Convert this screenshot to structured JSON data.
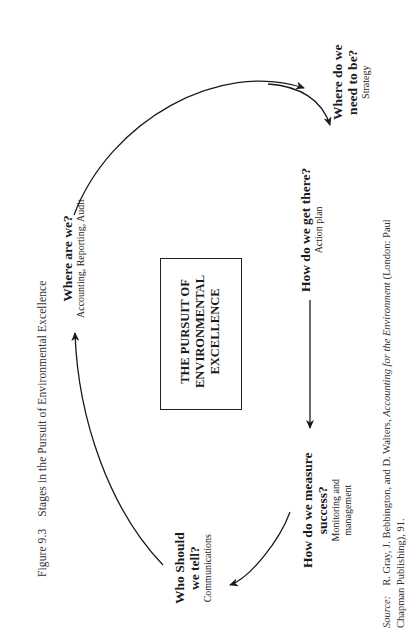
{
  "figure": {
    "number": "Figure 9.3",
    "title": "Stages in the Pursuit of Environmental Excellence"
  },
  "center_box": {
    "lines": [
      "THE PURSUIT OF",
      "ENVIRONMENTAL",
      "EXCELLENCE"
    ]
  },
  "stages": [
    {
      "id": "where-are-we",
      "question_lines": [
        "Where are we?"
      ],
      "detail_lines": [
        "Accounting,  Reporting, Audit"
      ]
    },
    {
      "id": "where-do-we-need-to-be",
      "question_lines": [
        "Where do we",
        "need to be?"
      ],
      "detail_lines": [
        "Strategy"
      ]
    },
    {
      "id": "how-do-we-get-there",
      "question_lines": [
        "How do we get there?"
      ],
      "detail_lines": [
        "Action plan"
      ]
    },
    {
      "id": "how-do-we-measure-success",
      "question_lines": [
        "How do we measure",
        "success?"
      ],
      "detail_lines": [
        "Monitoring and",
        "management"
      ]
    },
    {
      "id": "who-should-we-tell",
      "question_lines": [
        "Who Should",
        "we tell?"
      ],
      "detail_lines": [
        "Communications"
      ]
    }
  ],
  "flow": [
    "Where are we?",
    "Where do we need to be?",
    "How do we get there?",
    "How do we measure success?",
    "Who Should we tell?",
    "Where are we?"
  ],
  "source": {
    "label": "Source:",
    "line1_pre": "R. Gray, J. Bebbington, and D. Walters, ",
    "line1_title": "Accounting for the Environment",
    "line1_post": " (London: Paul",
    "line2": "Chapman Publishing), 91."
  },
  "colors": {
    "ink": "#1a1a1a",
    "background": "#ffffff"
  }
}
